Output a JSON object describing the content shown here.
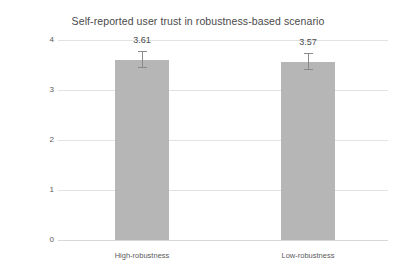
{
  "chart_data": {
    "type": "bar",
    "title": "Self-reported user trust in robustness-based scenario",
    "xlabel": "",
    "ylabel": "Self-reproted User Trust Level",
    "categories": [
      "High-robustness",
      "Low-robustness"
    ],
    "values": [
      3.61,
      3.57
    ],
    "value_labels": [
      "3.61",
      "3.57"
    ],
    "errors": [
      0.17,
      0.17
    ],
    "ylim": [
      0,
      4
    ],
    "ytick_labels": [
      "4",
      "3",
      "2",
      "1",
      "0"
    ],
    "ytick_values": [
      4,
      3,
      2,
      1,
      0
    ],
    "grid": true,
    "legend": false,
    "bar_color": "#b6b6b6",
    "gridline_color": "#e2e2e2",
    "errorbar_color": "#8a8a8a",
    "text_color": "#4a4a4a"
  }
}
